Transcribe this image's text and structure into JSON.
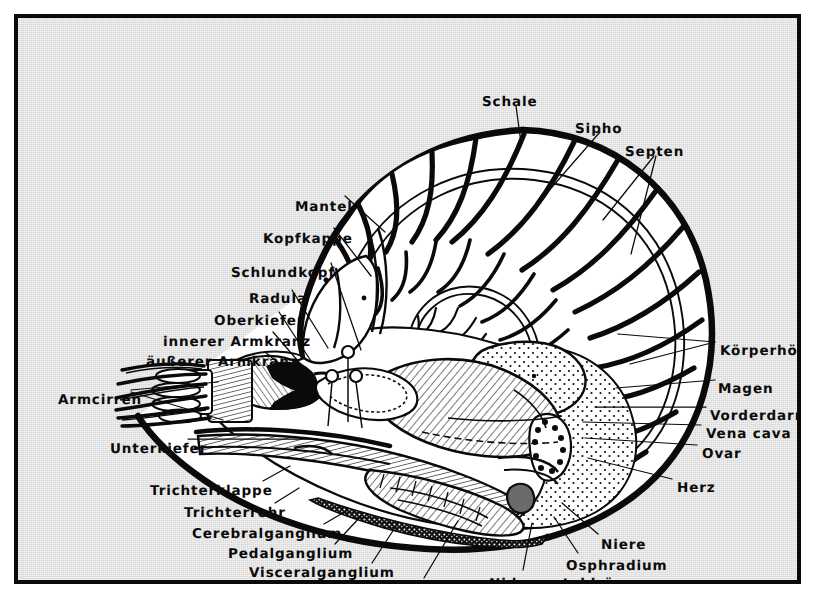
{
  "figure": {
    "language": "de",
    "frame_color": "#0a0a0a",
    "plate_color": "#d7d7d7",
    "ink_color": "#0a0a0a"
  },
  "labels": [
    {
      "id": "schale",
      "text": "Schale",
      "x": 464,
      "y": 78,
      "align": "left"
    },
    {
      "id": "sipho",
      "text": "Sipho",
      "x": 557,
      "y": 105,
      "align": "left"
    },
    {
      "id": "septen",
      "text": "Septen",
      "x": 607,
      "y": 128,
      "align": "left"
    },
    {
      "id": "mantel",
      "text": "Mantel",
      "x": 277,
      "y": 183,
      "align": "left"
    },
    {
      "id": "kopfkappe",
      "text": "Kopfkappe",
      "x": 245,
      "y": 215,
      "align": "left"
    },
    {
      "id": "schlundkopf",
      "text": "Schlundkopf",
      "x": 213,
      "y": 249,
      "align": "left"
    },
    {
      "id": "radula",
      "text": "Radula",
      "x": 231,
      "y": 275,
      "align": "left"
    },
    {
      "id": "oberkiefer",
      "text": "Oberkiefer",
      "x": 196,
      "y": 297,
      "align": "left"
    },
    {
      "id": "innerer-armkranz",
      "text": "innerer Armkranz",
      "x": 145,
      "y": 318,
      "align": "left"
    },
    {
      "id": "aeusserer-armkranz",
      "text": "äußerer Armkranz",
      "x": 128,
      "y": 338,
      "align": "left"
    },
    {
      "id": "armcirren",
      "text": "Armcirren",
      "x": 40,
      "y": 376,
      "align": "left"
    },
    {
      "id": "unterkiefer",
      "text": "Unterkiefer",
      "x": 92,
      "y": 425,
      "align": "left"
    },
    {
      "id": "trichterklappe",
      "text": "Trichterklappe",
      "x": 132,
      "y": 467,
      "align": "left"
    },
    {
      "id": "trichterrohr",
      "text": "Trichterrohr",
      "x": 166,
      "y": 489,
      "align": "left"
    },
    {
      "id": "cerebralganglium",
      "text": "Cerebralganglium",
      "x": 174,
      "y": 510,
      "align": "left"
    },
    {
      "id": "pedalganglium",
      "text": "Pedalganglium",
      "x": 210,
      "y": 530,
      "align": "left"
    },
    {
      "id": "visceralganglium",
      "text": "Visceralganglium",
      "x": 231,
      "y": 549,
      "align": "left"
    },
    {
      "id": "kieme",
      "text": "Kieme",
      "x": 383,
      "y": 568,
      "align": "left"
    },
    {
      "id": "nidamentaldruese",
      "text": "Nidamentaldrüse",
      "x": 471,
      "y": 560,
      "align": "left"
    },
    {
      "id": "osphradium",
      "text": "Osphradium",
      "x": 548,
      "y": 542,
      "align": "left"
    },
    {
      "id": "niere",
      "text": "Niere",
      "x": 583,
      "y": 521,
      "align": "left"
    },
    {
      "id": "koerperhoehle",
      "text": "Körperhöhle",
      "x": 702,
      "y": 327,
      "align": "left"
    },
    {
      "id": "magen",
      "text": "Magen",
      "x": 700,
      "y": 365,
      "align": "left"
    },
    {
      "id": "vorderdarm",
      "text": "Vorderdarm",
      "x": 692,
      "y": 392,
      "align": "left"
    },
    {
      "id": "vena-cava",
      "text": "Vena cava",
      "x": 688,
      "y": 410,
      "align": "left"
    },
    {
      "id": "ovar",
      "text": "Ovar",
      "x": 684,
      "y": 430,
      "align": "left"
    },
    {
      "id": "herz",
      "text": "Herz",
      "x": 659,
      "y": 464,
      "align": "left"
    }
  ],
  "leaders": [
    {
      "id": "leader-schale",
      "d": "M 498 88  L 503 125"
    },
    {
      "id": "leader-sipho",
      "d": "M 582 114 L 528 176"
    },
    {
      "id": "leader-septen-a",
      "d": "M 636 138 L 585 202"
    },
    {
      "id": "leader-septen-b",
      "d": "M 638 138 L 613 236"
    },
    {
      "id": "leader-mantel",
      "d": "M 327 178 L 367 214"
    },
    {
      "id": "leader-kopfkappe",
      "d": "M 316 210 L 353 258"
    },
    {
      "id": "leader-schlundkopf",
      "d": "M 313 245 L 343 332"
    },
    {
      "id": "leader-radula",
      "d": "M 274 272 L 310 330"
    },
    {
      "id": "leader-oberkiefer",
      "d": "M 261 294 L 293 343"
    },
    {
      "id": "leader-innerer-armkranz",
      "d": "M 255 314 L 286 350"
    },
    {
      "id": "leader-aeusserer-armkranz",
      "d": "M 247 334 L 277 358"
    },
    {
      "id": "leader-armcirren-a",
      "d": "M 113 372 L 200 364"
    },
    {
      "id": "leader-armcirren-b",
      "d": "M 113 374 L 205 402"
    },
    {
      "id": "leader-unterkiefer",
      "d": "M 170 421 L 300 421"
    },
    {
      "id": "leader-trichterklappe",
      "d": "M 245 463 L 272 448"
    },
    {
      "id": "leader-trichterrohr",
      "d": "M 257 485 L 281 470"
    },
    {
      "id": "leader-cerebralganglium",
      "d": "M 306 506 L 330 492"
    },
    {
      "id": "leader-pedalganglium",
      "d": "M 317 526 L 343 498"
    },
    {
      "id": "leader-visceralganglium",
      "d": "M 354 545 L 380 505"
    },
    {
      "id": "leader-kieme",
      "d": "M 406 560 L 440 503"
    },
    {
      "id": "leader-nidamentaldruese",
      "d": "M 505 552 L 514 505"
    },
    {
      "id": "leader-osphradium",
      "d": "M 560 535 L 536 499"
    },
    {
      "id": "leader-niere",
      "d": "M 580 516 L 544 485"
    },
    {
      "id": "leader-koerperhoehle-a",
      "d": "M 697 324 L 612 346"
    },
    {
      "id": "leader-koerperhoehle-b",
      "d": "M 697 324 L 600 316"
    },
    {
      "id": "leader-magen",
      "d": "M 697 362 L 598 370"
    },
    {
      "id": "leader-vorderdarm",
      "d": "M 688 389 L 577 389"
    },
    {
      "id": "leader-vena-cava",
      "d": "M 683 407 L 565 404"
    },
    {
      "id": "leader-ovar",
      "d": "M 679 427 L 567 420"
    },
    {
      "id": "leader-herz",
      "d": "M 654 461 L 570 440"
    }
  ],
  "chart_data": {
    "type": "diagram",
    "parts_count": 27
  }
}
